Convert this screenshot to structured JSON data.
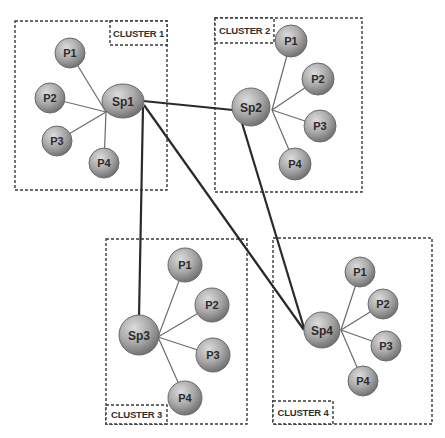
{
  "diagram": {
    "type": "cluster-topology",
    "colors": {
      "background": "#ffffff",
      "border": "#3a3a3a",
      "node_light": "#d6d6d6",
      "node_dark": "#7d7d7d",
      "node_stroke": "#6a6a6a",
      "thin_link": "#6b6b6b",
      "thick_link": "#2a2a2a",
      "label_text": "#2b2b2b"
    },
    "clusters": [
      {
        "id": "c1",
        "label": "CLUSTER 1",
        "box": {
          "x": 15,
          "y": 21,
          "w": 152,
          "h": 169
        },
        "label_box": {
          "x": 110,
          "y": 21,
          "w": 57,
          "h": 24
        },
        "hub": {
          "id": "Sp1",
          "label": "Sp1",
          "cx": 123,
          "cy": 101,
          "rx": 21,
          "ry": 17,
          "link_origin": [
            106,
            112
          ]
        },
        "peers": [
          {
            "label": "P1",
            "cx": 70,
            "cy": 53,
            "r": 15
          },
          {
            "label": "P2",
            "cx": 50,
            "cy": 98,
            "r": 15
          },
          {
            "label": "P3",
            "cx": 57,
            "cy": 141,
            "r": 15
          },
          {
            "label": "P4",
            "cx": 104,
            "cy": 163,
            "r": 15
          }
        ]
      },
      {
        "id": "c2",
        "label": "CLUSTER 2",
        "box": {
          "x": 215,
          "y": 18,
          "w": 147,
          "h": 174
        },
        "label_box": {
          "x": 215,
          "y": 18,
          "w": 59,
          "h": 25
        },
        "hub": {
          "id": "Sp2",
          "label": "Sp2",
          "cx": 251,
          "cy": 107,
          "rx": 19,
          "ry": 19,
          "link_origin": [
            272,
            110
          ]
        },
        "peers": [
          {
            "label": "P1",
            "cx": 291,
            "cy": 41,
            "r": 16
          },
          {
            "label": "P2",
            "cx": 318,
            "cy": 79,
            "r": 16
          },
          {
            "label": "P3",
            "cx": 320,
            "cy": 126,
            "r": 16
          },
          {
            "label": "P4",
            "cx": 295,
            "cy": 164,
            "r": 16
          }
        ]
      },
      {
        "id": "c3",
        "label": "CLUSTER 3",
        "box": {
          "x": 106,
          "y": 239,
          "w": 141,
          "h": 185
        },
        "label_box": {
          "x": 106,
          "y": 405,
          "w": 61,
          "h": 19
        },
        "hub": {
          "id": "Sp3",
          "label": "Sp3",
          "cx": 139,
          "cy": 335,
          "rx": 20,
          "ry": 20,
          "link_origin": [
            158,
            337
          ]
        },
        "peers": [
          {
            "label": "P1",
            "cx": 185,
            "cy": 265,
            "r": 17
          },
          {
            "label": "P2",
            "cx": 212,
            "cy": 305,
            "r": 17
          },
          {
            "label": "P3",
            "cx": 213,
            "cy": 355,
            "r": 17
          },
          {
            "label": "P4",
            "cx": 185,
            "cy": 398,
            "r": 17
          }
        ]
      },
      {
        "id": "c4",
        "label": "CLUSTER 4",
        "box": {
          "x": 273,
          "y": 238,
          "w": 159,
          "h": 186
        },
        "label_box": {
          "x": 273,
          "y": 401,
          "w": 60,
          "h": 23
        },
        "hub": {
          "id": "Sp4",
          "label": "Sp4",
          "cx": 322,
          "cy": 330,
          "rx": 18,
          "ry": 18,
          "link_origin": [
            341,
            330
          ]
        },
        "peers": [
          {
            "label": "P1",
            "cx": 360,
            "cy": 272,
            "r": 15
          },
          {
            "label": "P2",
            "cx": 383,
            "cy": 304,
            "r": 15
          },
          {
            "label": "P3",
            "cx": 386,
            "cy": 346,
            "r": 15
          },
          {
            "label": "P4",
            "cx": 363,
            "cy": 381,
            "r": 15
          }
        ]
      }
    ],
    "inter_links": [
      {
        "from": "Sp1",
        "to": "Sp2",
        "points": [
          [
            143,
            101
          ],
          [
            233,
            110
          ]
        ]
      },
      {
        "from": "Sp1",
        "to": "Sp3",
        "points": [
          [
            143,
            107
          ],
          [
            139,
            317
          ]
        ]
      },
      {
        "from": "Sp1",
        "to": "Sp4",
        "points": [
          [
            144,
            105
          ],
          [
            304,
            330
          ]
        ]
      },
      {
        "from": "Sp2",
        "to": "Sp4",
        "points": [
          [
            242,
            123
          ],
          [
            304,
            328
          ]
        ]
      }
    ]
  }
}
